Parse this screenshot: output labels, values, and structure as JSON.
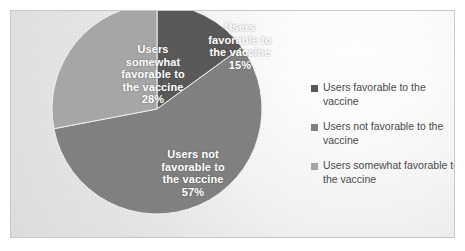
{
  "chart_data": {
    "type": "pie",
    "title": "",
    "subtitle": "",
    "xlabel": "",
    "ylabel": "",
    "grid": false,
    "legend_position": "right",
    "categories": [
      "Users favorable to the vaccine",
      "Users not favorable to the vaccine",
      "Users somewhat favorable to the vaccine"
    ],
    "values": [
      15,
      57,
      28
    ],
    "value_suffix": "%",
    "start_angle_deg": 0,
    "direction": "clockwise",
    "colors": [
      "#595959",
      "#808080",
      "#a6a6a6"
    ],
    "slices": [
      {
        "name": "Users favorable to the vaccine",
        "value": 15,
        "label": "Users\nfavorable to\nthe vaccine\n15%",
        "percent_text": "15%",
        "color": "#595959"
      },
      {
        "name": "Users not favorable to the vaccine",
        "value": 57,
        "label": "Users not\nfavorable to\nthe vaccine\n57%",
        "percent_text": "57%",
        "color": "#808080"
      },
      {
        "name": "Users somewhat favorable to the vaccine",
        "value": 28,
        "label": "Users\nsomewhat\nfavorable to\nthe vaccine\n28%",
        "percent_text": "28%",
        "color": "#a6a6a6"
      }
    ]
  },
  "legend": {
    "items": [
      {
        "label": "Users favorable to the vaccine",
        "color": "#595959",
        "marker": "square-marker-icon"
      },
      {
        "label": "Users not favorable to the vaccine",
        "color": "#808080",
        "marker": "square-marker-icon"
      },
      {
        "label": "Users somewhat favorable to the vaccine",
        "color": "#a6a6a6",
        "marker": "square-marker-icon"
      }
    ]
  },
  "panel": {
    "border_color": "#c9c9c9",
    "background_color": "#eaeaea"
  }
}
